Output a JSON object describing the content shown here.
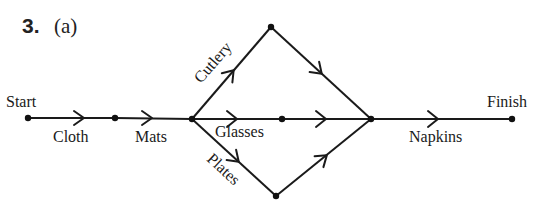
{
  "question": {
    "number": "3.",
    "part": "(a)"
  },
  "nodes": {
    "start": {
      "label": "Start",
      "x": 28,
      "y": 118
    },
    "n2": {
      "x": 115,
      "y": 118
    },
    "n3": {
      "x": 192,
      "y": 119
    },
    "top": {
      "x": 271,
      "y": 27
    },
    "mid": {
      "x": 282,
      "y": 119
    },
    "bottom": {
      "x": 276,
      "y": 196
    },
    "n4": {
      "x": 371,
      "y": 119
    },
    "finish": {
      "label": "Finish",
      "x": 512,
      "y": 119
    }
  },
  "edges": [
    {
      "from": "start",
      "to": "n2",
      "label": "Cloth"
    },
    {
      "from": "n2",
      "to": "n3",
      "label": "Mats"
    },
    {
      "from": "n3",
      "to": "top",
      "label": "Cutlery"
    },
    {
      "from": "top",
      "to": "n4",
      "label": ""
    },
    {
      "from": "n3",
      "to": "mid",
      "label": "Glasses"
    },
    {
      "from": "mid",
      "to": "n4",
      "label": ""
    },
    {
      "from": "n3",
      "to": "bottom",
      "label": "Plates"
    },
    {
      "from": "bottom",
      "to": "n4",
      "label": ""
    },
    {
      "from": "n4",
      "to": "finish",
      "label": "Napkins"
    }
  ],
  "labels": {
    "start": "Start",
    "finish": "Finish",
    "cloth": "Cloth",
    "mats": "Mats",
    "cutlery": "Cutlery",
    "glasses": "Glasses",
    "plates": "Plates",
    "napkins": "Napkins"
  }
}
